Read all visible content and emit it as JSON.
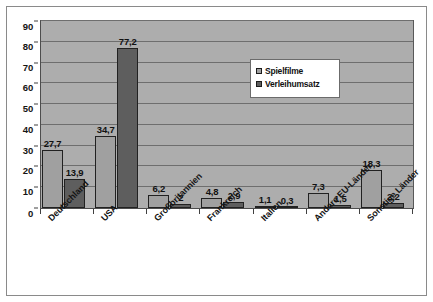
{
  "chart_data": {
    "type": "bar",
    "title": "",
    "subtitle": "",
    "xlabel": "",
    "ylabel": "",
    "ylim": [
      0,
      90
    ],
    "yticks": [
      0,
      10,
      20,
      30,
      40,
      50,
      60,
      70,
      80,
      90
    ],
    "ytick_labels": [
      "0",
      "10",
      "20",
      "30",
      "40",
      "50",
      "60",
      "70",
      "80",
      "90"
    ],
    "grid": true,
    "legend_position": "upper-center-right",
    "decimal_separator": ",",
    "categories": [
      "Deutschland",
      "USA",
      "Großbritannien",
      "Frankreich",
      "Italien",
      "Andere EU-Länder",
      "Sonstige Länder"
    ],
    "series": [
      {
        "name": "Spielfilme",
        "color": "#a0a0a0",
        "values": [
          27.7,
          34.7,
          6.2,
          4.8,
          1.1,
          7.3,
          18.3
        ],
        "labels": [
          "27,7",
          "34,7",
          "6,2",
          "4,8",
          "1,1",
          "7,3",
          "18,3"
        ]
      },
      {
        "name": "Verleihumsatz",
        "color": "#5e5e5e",
        "values": [
          13.9,
          77.2,
          2.0,
          2.9,
          0.3,
          1.5,
          2.2
        ],
        "labels": [
          "13,9",
          "77,2",
          "2",
          "2,9",
          "0,3",
          "1,5",
          "2,2"
        ]
      }
    ]
  },
  "style": {
    "plot_background": "#adadad",
    "figure_background": "#ffffff",
    "gridline_color": "#6e6e6e",
    "frame_color": "#8a8a8a"
  }
}
